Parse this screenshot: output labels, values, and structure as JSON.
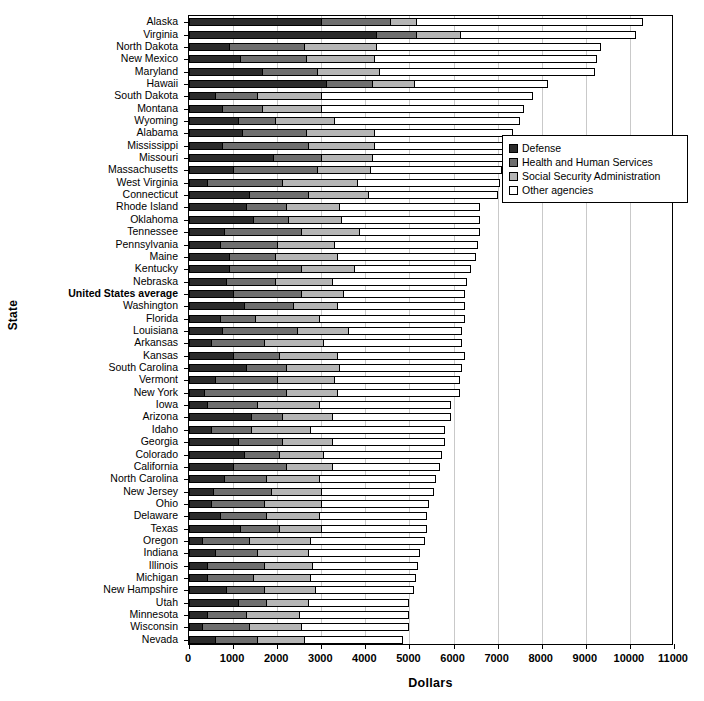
{
  "chart_data": {
    "type": "bar",
    "orientation": "horizontal",
    "stacked": true,
    "title": "",
    "xlabel": "Dollars",
    "ylabel": "State",
    "xlim": [
      0,
      11000
    ],
    "xticks": [
      0,
      1000,
      2000,
      3000,
      4000,
      5000,
      6000,
      7000,
      8000,
      9000,
      10000,
      11000
    ],
    "grid": "vertical",
    "legend_position": "right-upper",
    "series": [
      {
        "name": "Defense",
        "color": "#2b2b2b"
      },
      {
        "name": "Health and Human Services",
        "color": "#6e6e6e"
      },
      {
        "name": "Social Security Administration",
        "color": "#b5b5b5"
      },
      {
        "name": "Other agencies",
        "color": "#ffffff"
      }
    ],
    "categories": [
      "Alaska",
      "Virginia",
      "North Dakota",
      "New Mexico",
      "Maryland",
      "Hawaii",
      "South Dakota",
      "Montana",
      "Wyoming",
      "Alabama",
      "Mississippi",
      "Missouri",
      "Massachusetts",
      "West Virginia",
      "Connecticut",
      "Rhode Island",
      "Oklahoma",
      "Tennessee",
      "Pennsylvania",
      "Maine",
      "Kentucky",
      "Nebraska",
      "United States average",
      "Washington",
      "Florida",
      "Louisiana",
      "Arkansas",
      "Kansas",
      "South Carolina",
      "Vermont",
      "New York",
      "Iowa",
      "Arizona",
      "Idaho",
      "Georgia",
      "Colorado",
      "California",
      "North Carolina",
      "New Jersey",
      "Ohio",
      "Delaware",
      "Texas",
      "Oregon",
      "Indiana",
      "Illinois",
      "Michigan",
      "New Hampshire",
      "Utah",
      "Minnesota",
      "Wisconsin",
      "Nevada"
    ],
    "highlight_category": "United States average",
    "values": [
      [
        3000,
        1550,
        600,
        5150
      ],
      [
        4250,
        900,
        1000,
        4000
      ],
      [
        900,
        1700,
        1650,
        5100
      ],
      [
        1150,
        1500,
        1550,
        5050
      ],
      [
        1650,
        1250,
        1400,
        4900
      ],
      [
        3100,
        1050,
        950,
        3050
      ],
      [
        600,
        950,
        1450,
        4800
      ],
      [
        750,
        900,
        1350,
        4600
      ],
      [
        1100,
        850,
        1350,
        4200
      ],
      [
        1200,
        1450,
        1550,
        3150
      ],
      [
        750,
        1950,
        1500,
        3100
      ],
      [
        1900,
        1100,
        1150,
        3000
      ],
      [
        1000,
        1900,
        1200,
        3000
      ],
      [
        400,
        1700,
        1700,
        3250
      ],
      [
        1350,
        1350,
        1350,
        2950
      ],
      [
        1300,
        900,
        1200,
        3200
      ],
      [
        1450,
        800,
        1200,
        3150
      ],
      [
        800,
        1750,
        1300,
        2750
      ],
      [
        700,
        1300,
        1300,
        3250
      ],
      [
        900,
        1050,
        1400,
        3150
      ],
      [
        900,
        1650,
        1200,
        2650
      ],
      [
        850,
        1100,
        1300,
        3050
      ],
      [
        1000,
        1550,
        950,
        2750
      ],
      [
        1250,
        1100,
        1000,
        2900
      ],
      [
        700,
        800,
        1450,
        3300
      ],
      [
        750,
        1700,
        1150,
        2600
      ],
      [
        500,
        1200,
        1350,
        3150
      ],
      [
        1000,
        1050,
        1300,
        2900
      ],
      [
        1300,
        900,
        1200,
        2800
      ],
      [
        600,
        1400,
        1300,
        2850
      ],
      [
        350,
        1850,
        1150,
        2800
      ],
      [
        400,
        1150,
        1400,
        3000
      ],
      [
        1400,
        700,
        1150,
        2700
      ],
      [
        500,
        900,
        1350,
        3050
      ],
      [
        1100,
        1000,
        1150,
        2550
      ],
      [
        1250,
        800,
        1000,
        2700
      ],
      [
        1000,
        1200,
        1050,
        2450
      ],
      [
        800,
        950,
        1200,
        2650
      ],
      [
        550,
        1300,
        1150,
        2550
      ],
      [
        500,
        1200,
        1300,
        2450
      ],
      [
        700,
        1050,
        1200,
        2450
      ],
      [
        1150,
        900,
        950,
        2400
      ],
      [
        300,
        1050,
        1400,
        2600
      ],
      [
        600,
        950,
        1150,
        2550
      ],
      [
        400,
        1300,
        1100,
        2400
      ],
      [
        400,
        1050,
        1300,
        2400
      ],
      [
        850,
        850,
        1150,
        2250
      ],
      [
        1100,
        650,
        950,
        2300
      ],
      [
        400,
        900,
        1200,
        2500
      ],
      [
        300,
        1050,
        1200,
        2450
      ],
      [
        600,
        950,
        1050,
        2250
      ]
    ]
  }
}
